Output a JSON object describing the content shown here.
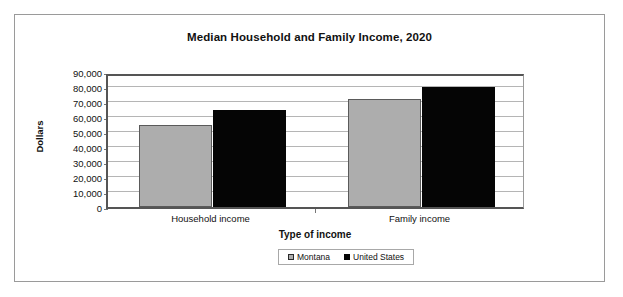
{
  "chart_data": {
    "type": "bar",
    "title": "Median Household and Family Income, 2020",
    "xlabel": "Type of income",
    "ylabel": "Dollars",
    "categories": [
      "Household income",
      "Family income"
    ],
    "series": [
      {
        "name": "Montana",
        "color": "#adadad",
        "values": [
          55000,
          72000
        ]
      },
      {
        "name": "United States",
        "color": "#050505",
        "values": [
          65000,
          80000
        ]
      }
    ],
    "ylim": [
      0,
      90000
    ],
    "ytick_values": [
      0,
      10000,
      20000,
      30000,
      40000,
      50000,
      60000,
      70000,
      80000,
      90000
    ],
    "ytick_labels": [
      "0",
      "10,000",
      "20,000",
      "30,000",
      "40,000",
      "50,000",
      "60,000",
      "70,000",
      "80,000",
      "90,000"
    ],
    "grid": true,
    "legend_position": "bottom"
  },
  "legend": {
    "entries": [
      {
        "label": "Montana",
        "swatch": "legend-swatch-montana"
      },
      {
        "label": "United States",
        "swatch": "legend-swatch-united-states"
      }
    ]
  }
}
